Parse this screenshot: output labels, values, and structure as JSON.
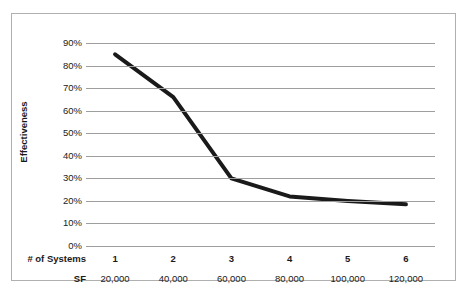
{
  "chart_data": {
    "type": "line",
    "title": "",
    "subtitle": "",
    "xlabel": "# of Systems",
    "ylabel": "Effectiveness",
    "categories": [
      "1",
      "2",
      "3",
      "4",
      "5",
      "6"
    ],
    "values": [
      0.85,
      0.66,
      0.3,
      0.22,
      0.2,
      0.185
    ],
    "value_labels": [
      "85%",
      "66%",
      "30%",
      "22%",
      "20%",
      "18.5%"
    ],
    "secondary_axis": {
      "label": "SF",
      "tick_labels": [
        "20,000",
        "40,000",
        "60,000",
        "80,000",
        "100,000",
        "120,000"
      ],
      "values": [
        20000,
        40000,
        60000,
        80000,
        100000,
        120000
      ]
    },
    "ylim": [
      0,
      0.9
    ],
    "y_tick_labels": [
      "90%",
      "80%",
      "70%",
      "60%",
      "50%",
      "40%",
      "30%",
      "20%",
      "10%",
      "0%"
    ],
    "y_tick_values": [
      0.9,
      0.8,
      0.7,
      0.6,
      0.5,
      0.4,
      0.3,
      0.2,
      0.1,
      0.0
    ],
    "grid": true,
    "legend": "none",
    "series_color": "#1a1a1a",
    "gridline_color": "#9e9e9e",
    "border_color": "#b0b0b0",
    "background_color": "#ffffff",
    "series_line_width": 4
  }
}
